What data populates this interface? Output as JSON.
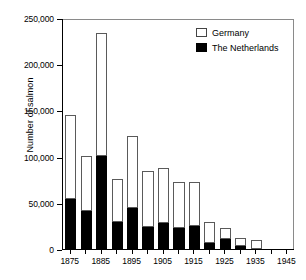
{
  "chart_data": {
    "type": "bar",
    "subtype": "stacked-vertical",
    "title": "",
    "xlabel": "",
    "ylabel": "Number of salmon",
    "ylim": [
      0,
      250000
    ],
    "ytick_labels": [
      "0",
      "50,000",
      "100,000",
      "150,000",
      "200,000",
      "250,000"
    ],
    "ytick_values": [
      0,
      50000,
      100000,
      150000,
      200000,
      250000
    ],
    "grid": false,
    "legend_position": "top-right",
    "categories": [
      1875,
      1880,
      1885,
      1890,
      1895,
      1900,
      1905,
      1910,
      1915,
      1920,
      1925,
      1930,
      1935,
      1940,
      1945
    ],
    "xtick_labels": [
      "1875",
      "1885",
      "1895",
      "1905",
      "1915",
      "1925",
      "1935",
      "1945"
    ],
    "xtick_values": [
      1875,
      1885,
      1895,
      1905,
      1915,
      1925,
      1935,
      1945
    ],
    "series": [
      {
        "name": "The Netherlands",
        "color": "#000000",
        "values": [
          54000,
          41000,
          101000,
          29000,
          44000,
          24000,
          28000,
          23000,
          25000,
          7000,
          11000,
          3000,
          0,
          0,
          0
        ]
      },
      {
        "name": "Germany",
        "color": "#ffffff",
        "values": [
          91000,
          60000,
          133000,
          47000,
          78000,
          60000,
          60000,
          49000,
          48000,
          22000,
          12000,
          9000,
          10000,
          0,
          0
        ]
      }
    ],
    "totals": [
      145000,
      101000,
      234000,
      76000,
      122000,
      84000,
      88000,
      72000,
      73000,
      29000,
      23000,
      12000,
      10000,
      0,
      0
    ]
  },
  "legend": {
    "items": [
      {
        "label": "Germany",
        "swatch": "white-square"
      },
      {
        "label": "The Netherlands",
        "swatch": "black-square"
      }
    ]
  }
}
